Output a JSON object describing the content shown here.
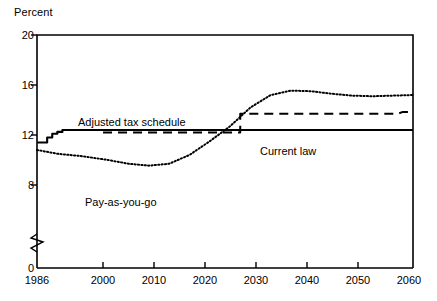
{
  "chart_data": {
    "type": "line",
    "title": "",
    "ylabel": "Percent",
    "xlabel": "",
    "ylim": [
      8,
      20
    ],
    "y_axis_break": true,
    "y_break_note": "axis broken between 0 and 8",
    "yticks": [
      {
        "value": 20,
        "label": "20"
      },
      {
        "value": 16,
        "label": "16"
      },
      {
        "value": 12,
        "label": "12"
      },
      {
        "value": 8,
        "label": "8"
      },
      {
        "value": 0,
        "label": "0"
      }
    ],
    "xlim": [
      1986,
      2060
    ],
    "xticks": [
      {
        "value": 1986,
        "label": "1986"
      },
      {
        "value": 2000,
        "label": "2000"
      },
      {
        "value": 2010,
        "label": "2010"
      },
      {
        "value": 2020,
        "label": "2020"
      },
      {
        "value": 2030,
        "label": "2030"
      },
      {
        "value": 2040,
        "label": "2040"
      },
      {
        "value": 2050,
        "label": "2050"
      },
      {
        "value": 2060,
        "label": "2060"
      }
    ],
    "grid": false,
    "legend_position": "inline-annotations",
    "series": [
      {
        "name": "Current law",
        "style": "solid",
        "label_text": "Current law",
        "x": [
          1986,
          1987,
          1988,
          1988,
          1989,
          1989,
          1990,
          1990,
          1991,
          1991,
          2000,
          2010,
          2020,
          2030,
          2040,
          2050,
          2060
        ],
        "values": [
          11.4,
          11.4,
          11.4,
          11.8,
          11.8,
          12.1,
          12.1,
          12.25,
          12.25,
          12.4,
          12.4,
          12.4,
          12.4,
          12.4,
          12.4,
          12.4,
          12.4
        ]
      },
      {
        "name": "Adjusted tax schedule",
        "style": "dashed",
        "label_text": "Adjusted tax schedule",
        "x": [
          1999,
          2002,
          2010,
          2020,
          2026,
          2026,
          2030,
          2040,
          2050,
          2057,
          2058,
          2060
        ],
        "values": [
          12.2,
          12.2,
          12.2,
          12.2,
          12.2,
          13.7,
          13.7,
          13.7,
          13.7,
          13.7,
          13.85,
          13.85
        ]
      },
      {
        "name": "Pay-as-you-go",
        "style": "dotted",
        "label_text": "Pay-as-you-go",
        "x": [
          1986,
          1990,
          1995,
          2000,
          2004,
          2008,
          2012,
          2016,
          2020,
          2024,
          2028,
          2032,
          2036,
          2040,
          2044,
          2048,
          2052,
          2056,
          2060
        ],
        "values": [
          10.8,
          10.5,
          10.3,
          10.0,
          9.7,
          9.55,
          9.7,
          10.4,
          11.5,
          12.7,
          14.2,
          15.2,
          15.55,
          15.5,
          15.3,
          15.15,
          15.1,
          15.15,
          15.2
        ]
      }
    ],
    "annotations": [
      {
        "text": "Adjusted tax schedule",
        "x": 2002,
        "y": 13.3
      },
      {
        "text": "Pay-as-you-go",
        "x": 2005,
        "y": 8.9
      },
      {
        "text": "Current law",
        "x": 2038,
        "y": 11.6
      }
    ]
  }
}
